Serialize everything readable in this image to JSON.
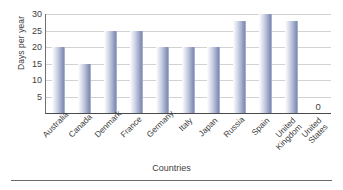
{
  "chart_data": {
    "type": "bar",
    "title": "",
    "xlabel": "Countries",
    "ylabel": "Days per year",
    "categories": [
      "Australia",
      "Canada",
      "Denmark",
      "France",
      "Germany",
      "Italy",
      "Japan",
      "Russia",
      "Spain",
      "United Kingdom",
      "United States"
    ],
    "values": [
      20,
      15,
      25,
      25,
      20,
      20,
      20,
      28,
      30,
      28,
      0
    ],
    "data_labels": [
      "",
      "",
      "",
      "",
      "",
      "",
      "",
      "",
      "",
      "",
      "0"
    ],
    "ylim": [
      0,
      30
    ],
    "ytick_labels": [
      "5",
      "10",
      "15",
      "20",
      "25",
      "30"
    ],
    "ytick_values": [
      5,
      10,
      15,
      20,
      25,
      30
    ],
    "grid": true,
    "legend": false,
    "bar_color": "#8e99bd",
    "grid_color": "#d2d2d2",
    "axis_color": "#4a4a4a"
  }
}
